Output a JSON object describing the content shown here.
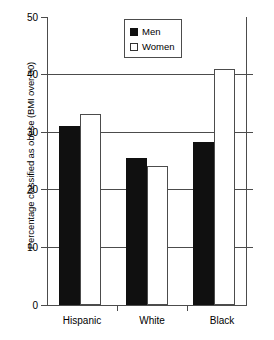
{
  "chart_data": {
    "type": "bar",
    "title": "",
    "xlabel": "",
    "ylabel": "Percentage classified as obese (BMI over 30)",
    "categories": [
      "Hispanic",
      "White",
      "Black"
    ],
    "series": [
      {
        "name": "Men",
        "values": [
          31.0,
          25.5,
          28.3
        ],
        "color": "#101010",
        "swatch": "filled-square"
      },
      {
        "name": "Women",
        "values": [
          33.2,
          24.2,
          41.0
        ],
        "color": "#ffffff",
        "swatch": "hollow-square"
      }
    ],
    "ylim": [
      0,
      50
    ],
    "yticks": [
      0,
      10,
      20,
      30,
      40,
      50
    ],
    "ytick_labels": [
      "0",
      "10",
      "20",
      "30",
      "40",
      "50"
    ],
    "grid": true,
    "grid_axis": "y",
    "legend_position": "top-center"
  },
  "legend": {
    "items": [
      {
        "label": "Men"
      },
      {
        "label": "Women"
      }
    ]
  },
  "axes": {
    "y_title": "Percentage classified as obese (BMI over 30)",
    "y_ticks": [
      "0",
      "10",
      "20",
      "30",
      "40",
      "50"
    ],
    "x_categories": [
      "Hispanic",
      "White",
      "Black"
    ]
  }
}
